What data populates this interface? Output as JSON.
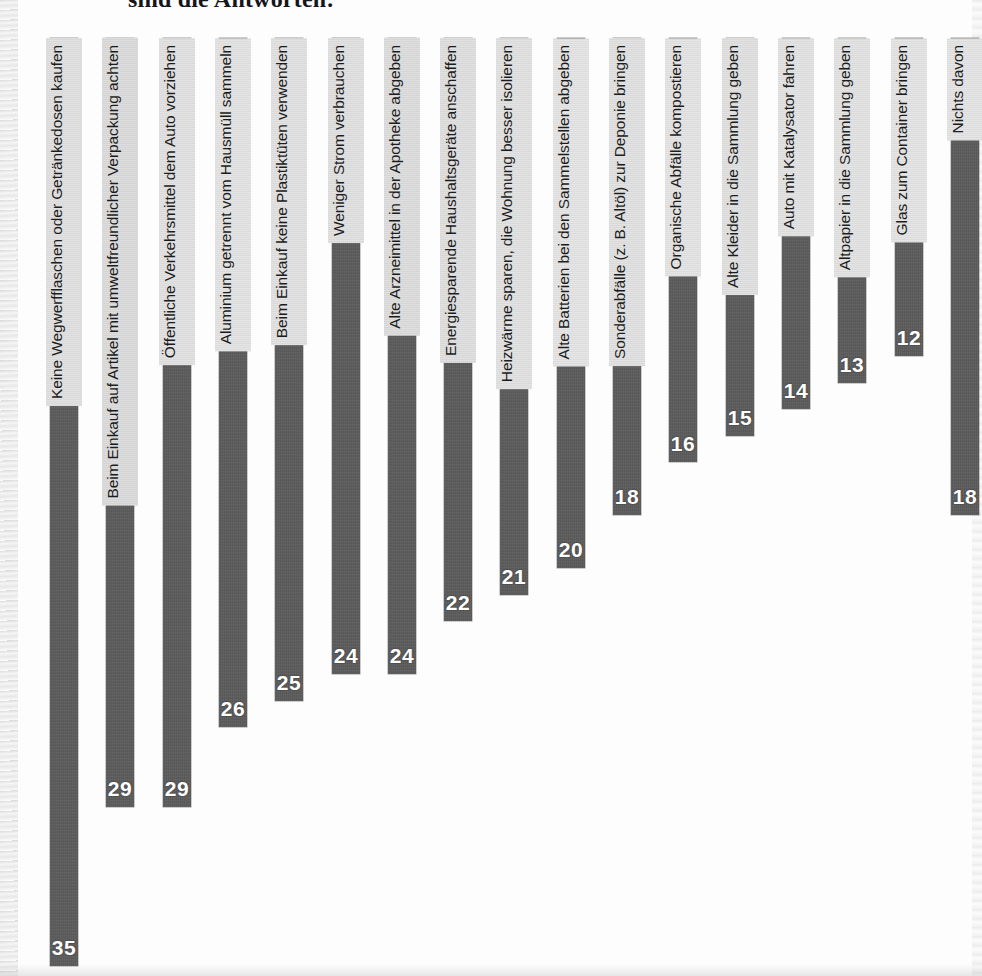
{
  "page": {
    "title_partial": "sind die Antworten:",
    "background_color": "#fdfdfd",
    "bar_color": "#5a5a5a",
    "label_band_color": "#dadada",
    "value_text_color": "#ffffff"
  },
  "chart_data": {
    "type": "bar",
    "title": "sind die Antworten:",
    "xlabel": "",
    "ylabel": "",
    "ylim": [
      0,
      35
    ],
    "grid": false,
    "legend": null,
    "orientation": "vertical",
    "value_label_position": "inside-bottom",
    "categories": [
      "Keine Wegwerfflaschen oder Getränkedosen kaufen",
      "Beim Einkauf auf Artikel mit umweltfreundlicher Verpackung achten",
      "Öffentliche Verkehrsmittel dem Auto vorziehen",
      "Aluminium getrennt vom Hausmüll sammeln",
      "Beim Einkauf keine Plastiktüten verwenden",
      "Weniger Strom verbrauchen",
      "Alte Arzneimittel in der Apotheke abgeben",
      "Energiesparende Haushaltsgeräte anschaffen",
      "Heizwärme sparen, die Wohnung besser isolieren",
      "Alte Batterien bei den Sammelstellen abgeben",
      "Sonderabfälle (z. B. Altöl) zur Deponie bringen",
      "Organische Abfälle kompostieren",
      "Alte Kleider in die Sammlung geben",
      "Auto mit Katalysator fahren",
      "Altpapier in die Sammlung geben",
      "Glas zum Container bringen",
      "Nichts davon"
    ],
    "values": [
      35,
      29,
      29,
      26,
      25,
      24,
      24,
      22,
      21,
      20,
      18,
      16,
      15,
      14,
      13,
      12,
      18
    ]
  }
}
